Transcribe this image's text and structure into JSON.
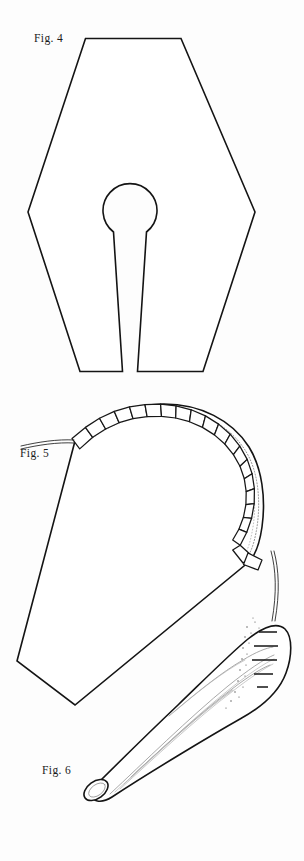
{
  "sheet": {
    "background_color": "#fdfdfd",
    "ink_color": "#141414",
    "width": 304,
    "height": 861
  },
  "figures": [
    {
      "id": "fig-4",
      "label": "Fig. 4",
      "caption_position": "upper-left",
      "description": "Hexagonal flat pattern piece with central keyhole opening"
    },
    {
      "id": "fig-5",
      "label": "Fig. 5",
      "caption_position": "middle-left",
      "description": "Dome shaped piece with segmented gathered edge and drawn thread"
    },
    {
      "id": "fig-6",
      "label": "Fig. 6",
      "caption_position": "lower-left",
      "description": "Tapered rolled cone with open tip and pleated upper edge"
    }
  ],
  "geometry": {
    "fig4": {
      "hexagon": "85,38 181,38 255,212 203,372 137,372 130,300 123,372 80,372 28,212",
      "keyhole_circle": {
        "cx": 130,
        "cy": 202,
        "r": 26
      },
      "keyhole_slot": "113,219 123,371 137,371 147,219",
      "bottom_edge_y": 372
    },
    "fig5": {
      "body": "75,440 17,662 75,706 255,560 250,520",
      "arc_start": {
        "x": 75,
        "y": 440
      },
      "arc_end": {
        "x": 255,
        "y": 558
      },
      "segment_count": 22,
      "thread_left": "20,447 75,440",
      "thread_right": "272,552 276,585 272,622"
    },
    "fig6": {
      "body": "80,790 106,766 200,640 245,600 278,612 289,650 278,690 240,717 120,800 92,801 80,790",
      "tip": {
        "cx": 95,
        "cy": 792,
        "rx": 13,
        "ry": 9
      },
      "pleat_ticks": 5
    }
  }
}
